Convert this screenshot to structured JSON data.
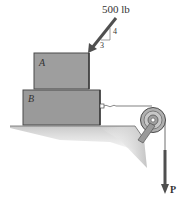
{
  "diagram": {
    "applied_force": {
      "label": "500 lb",
      "slope_rise": "4",
      "slope_run": "3"
    },
    "blocks": [
      {
        "id": "A",
        "label": "A"
      },
      {
        "id": "B",
        "label": "B"
      }
    ],
    "pull_force": {
      "label": "P"
    },
    "colors": {
      "block_fill": "#9a9a9a",
      "block_edge": "#4a4a4a",
      "ground_fill": "#cfcfcf",
      "arrow": "#4f4f4f",
      "pulley": "#8a8a8a"
    }
  }
}
